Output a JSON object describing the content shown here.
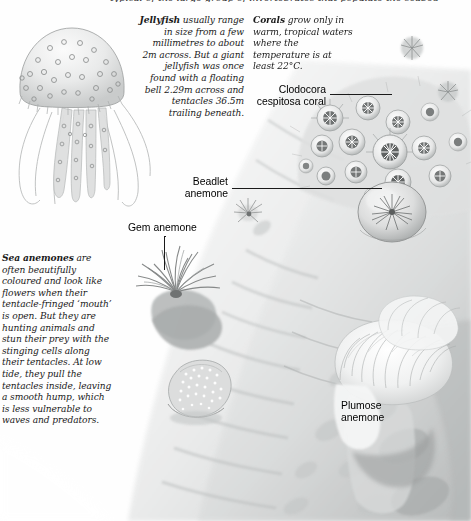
{
  "page": {
    "background_color": "#fefefe",
    "ink_color": "#1a1a1a"
  },
  "clipped_top_line": "typical of the large group of invertebrates that populate the seabed",
  "text_blocks": [
    {
      "id": "jellyfish",
      "lead": "Jellyfish",
      "body": " usually range in size from a few millimetres to about 2m across. But a giant jellyfish was once found with a floating bell 2.29m across and tentacles 36.5m trailing beneath.",
      "align": "right"
    },
    {
      "id": "corals",
      "lead": "Corals",
      "body": " grow only in warm, tropical waters where the temperature is at least 22°C.",
      "align": "left"
    },
    {
      "id": "sea_anemones",
      "lead": "Sea anemones",
      "body": " are often beautifully coloured and look like flowers when their tentacle-fringed ‘mouth’ is open. But they are hunting animals and stun their prey with the stinging cells along their tentacles. At low tide, they pull the tentacles inside, leaving a smooth hump, which is less vulnerable to waves and predators.",
      "align": "left"
    }
  ],
  "callouts": [
    {
      "id": "clodocora",
      "lines": [
        "Clodocora",
        "cespitosa coral"
      ]
    },
    {
      "id": "beadlet",
      "lines": [
        "Beadlet",
        "anemone"
      ]
    },
    {
      "id": "gem",
      "lines": [
        "Gem anemone"
      ]
    },
    {
      "id": "plumose",
      "lines": [
        "Plumose",
        "anemone"
      ]
    }
  ],
  "illustrations": [
    {
      "id": "jellyfish-illustration",
      "name": "spotted jellyfish with long trailing tentacles"
    },
    {
      "id": "coral-colony-illustration",
      "name": "Clodocora cespitosa coral polyp colony"
    },
    {
      "id": "beadlet-anemone-illustration",
      "name": "beadlet anemone closed dome with star centre"
    },
    {
      "id": "gem-anemone-illustration",
      "name": "gem anemone with radiating tentacles"
    },
    {
      "id": "retracted-anemone-illustration",
      "name": "retracted speckled anemone hump"
    },
    {
      "id": "plumose-anemone-illustration",
      "name": "plumose anemone feathery white crown"
    },
    {
      "id": "rock-face-illustration",
      "name": "sloping rock face habitat"
    }
  ]
}
